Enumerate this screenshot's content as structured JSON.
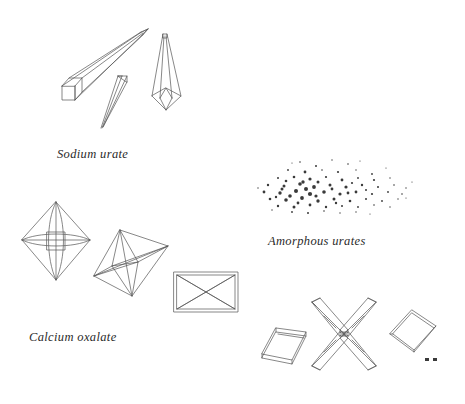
{
  "plate": {
    "title": "Urinary sediment crystals",
    "background_color": "#ffffff",
    "line_color": "#555555",
    "granule_color": "#3a3a3a",
    "caption_color": "#2a2a2a",
    "width": 465,
    "height": 404
  },
  "captions": [
    {
      "id": "sodium-urate",
      "text": "Sodium urate",
      "x": 57,
      "y": 147
    },
    {
      "id": "amorphous-urates",
      "text": "Amorphous urates",
      "x": 268,
      "y": 234
    },
    {
      "id": "calcium-oxalate",
      "text": "Calcium oxalate",
      "x": 29,
      "y": 330
    }
  ],
  "figures": [
    {
      "id": "sodium-urate-long-prism",
      "group": "sodium-urate",
      "shape_name": "elongated-needle-prism",
      "description": "Long square-sectioned prism tapering to a sharp point at upper right",
      "x": 62,
      "y": 30,
      "width": 88,
      "height": 75
    },
    {
      "id": "sodium-urate-thin-needle",
      "group": "sodium-urate",
      "shape_name": "slender-needle",
      "description": "Thin sliver needle pointing down-left with blunt top facet",
      "x": 100,
      "y": 74,
      "width": 30,
      "height": 54
    },
    {
      "id": "sodium-urate-upright-needle",
      "group": "sodium-urate",
      "shape_name": "upright-tapered-needle",
      "description": "Vertical needle tapering upward from a rhombic base",
      "x": 150,
      "y": 32,
      "width": 34,
      "height": 78
    },
    {
      "id": "amorphous-urate-granules",
      "group": "amorphous-urates",
      "shape_name": "granule-cloud",
      "description": "Dense scatter of fine dark amorphous granules",
      "x": 258,
      "y": 158,
      "width": 150,
      "height": 55,
      "granule_count": 230
    },
    {
      "id": "calcium-oxalate-octahedron-front",
      "group": "calcium-oxalate",
      "shape_name": "octahedron-envelope",
      "description": "Octahedral envelope crystal seen face-on with internal edges",
      "x": 20,
      "y": 200,
      "width": 72,
      "height": 80
    },
    {
      "id": "calcium-oxalate-octahedron-oblique",
      "group": "calcium-oxalate",
      "shape_name": "octahedron-oblique",
      "description": "Octahedral crystal tilted in oblique three-quarter view",
      "x": 92,
      "y": 228,
      "width": 78,
      "height": 72
    },
    {
      "id": "calcium-oxalate-rectangular-envelope",
      "group": "calcium-oxalate",
      "shape_name": "rectangular-envelope",
      "description": "Rectangular plate with crossed diagonal envelope markings",
      "x": 172,
      "y": 270,
      "width": 66,
      "height": 44
    },
    {
      "id": "calcium-oxalate-rhombic-plate-left",
      "group": "calcium-oxalate",
      "shape_name": "rhombic-plate",
      "description": "Thin rhombic plate showing plate thickness, tilted left",
      "x": 262,
      "y": 326,
      "width": 44,
      "height": 38
    },
    {
      "id": "calcium-oxalate-twinned-cross",
      "group": "calcium-oxalate",
      "shape_name": "twinned-cross-crystal",
      "description": "Three-dimensional X-shaped twinned crystal with four prismatic arms",
      "x": 310,
      "y": 300,
      "width": 68,
      "height": 68
    },
    {
      "id": "calcium-oxalate-rhombic-plate-right",
      "group": "calcium-oxalate",
      "shape_name": "rhombic-plate",
      "description": "Thin rhombic plate tilted right",
      "x": 390,
      "y": 310,
      "width": 46,
      "height": 44
    },
    {
      "id": "calcium-oxalate-specks",
      "group": "calcium-oxalate",
      "shape_name": "tiny-crystal-specks",
      "description": "Two minute dark crystal specks at lower right",
      "x": 425,
      "y": 358,
      "width": 12,
      "height": 5
    }
  ]
}
